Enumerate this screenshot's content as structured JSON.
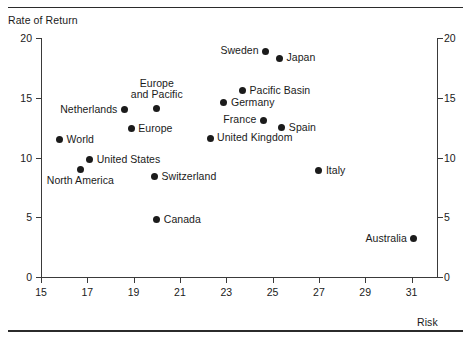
{
  "figure": {
    "y_axis_title": "Rate of Return",
    "x_axis_title": "Risk"
  },
  "chart_data": {
    "type": "scatter",
    "title": "",
    "xlabel": "Risk",
    "ylabel": "Rate of Return",
    "xlim": [
      15,
      32.1
    ],
    "ylim": [
      0,
      20
    ],
    "xticks": [
      15,
      17,
      19,
      21,
      23,
      25,
      27,
      29,
      31
    ],
    "yticks": [
      0,
      5,
      10,
      15,
      20
    ],
    "yticks_right": [
      0,
      5,
      10,
      15,
      20
    ],
    "grid": false,
    "legend": "none",
    "marker": "filled-circle",
    "marker_color": "#1b1b1b",
    "points": [
      {
        "label": "Sweden",
        "x": 24.7,
        "y": 18.9,
        "pos": "left"
      },
      {
        "label": "Japan",
        "x": 25.3,
        "y": 18.3,
        "pos": "right"
      },
      {
        "label": "Pacific Basin",
        "x": 23.7,
        "y": 15.6,
        "pos": "right"
      },
      {
        "label": "Europe\nand Pacific",
        "x": 20.0,
        "y": 14.1,
        "pos": "above"
      },
      {
        "label": "Germany",
        "x": 22.9,
        "y": 14.6,
        "pos": "right"
      },
      {
        "label": "Netherlands",
        "x": 18.6,
        "y": 14.0,
        "pos": "left"
      },
      {
        "label": "France",
        "x": 24.6,
        "y": 13.1,
        "pos": "left"
      },
      {
        "label": "Spain",
        "x": 25.4,
        "y": 12.5,
        "pos": "right"
      },
      {
        "label": "Europe",
        "x": 18.9,
        "y": 12.4,
        "pos": "right"
      },
      {
        "label": "United Kingdom",
        "x": 22.3,
        "y": 11.6,
        "pos": "right"
      },
      {
        "label": "World",
        "x": 15.8,
        "y": 11.5,
        "pos": "right"
      },
      {
        "label": "United States",
        "x": 17.1,
        "y": 9.8,
        "pos": "right"
      },
      {
        "label": "North America",
        "x": 16.7,
        "y": 9.0,
        "pos": "below"
      },
      {
        "label": "Switzerland",
        "x": 19.9,
        "y": 8.4,
        "pos": "right"
      },
      {
        "label": "Italy",
        "x": 27.0,
        "y": 8.9,
        "pos": "right"
      },
      {
        "label": "Canada",
        "x": 20.0,
        "y": 4.8,
        "pos": "right"
      },
      {
        "label": "Australia",
        "x": 31.1,
        "y": 3.2,
        "pos": "left"
      }
    ]
  }
}
